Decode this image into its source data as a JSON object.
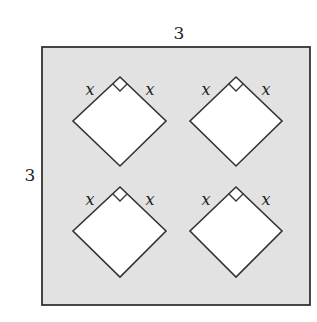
{
  "diagram": {
    "outer_square": {
      "label_top": "3",
      "label_left": "3",
      "fill": "#e2e2e2",
      "stroke": "#333333"
    },
    "cutouts": [
      {
        "id": "top-left",
        "label_left": "x",
        "label_right": "x",
        "right_angle": true
      },
      {
        "id": "top-right",
        "label_left": "x",
        "label_right": "x",
        "right_angle": true
      },
      {
        "id": "bottom-left",
        "label_left": "x",
        "label_right": "x",
        "right_angle": true
      },
      {
        "id": "bottom-right",
        "label_left": "x",
        "label_right": "x",
        "right_angle": true
      }
    ],
    "cutout_fill": "#ffffff"
  }
}
